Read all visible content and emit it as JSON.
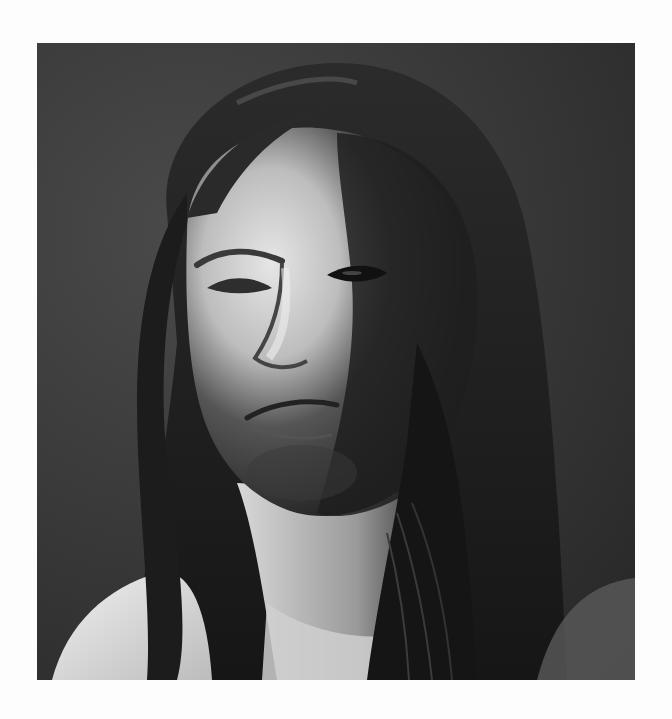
{
  "page": {
    "background": "#fdfdfd"
  },
  "photo": {
    "description": "Black-and-white portrait of a man with long dark hair, face lit from the left, dark studio background",
    "palette": {
      "background_dark": "#2a2a2a",
      "background_mid": "#444444",
      "hair": "#1a1a1a",
      "skin_highlight": "#e8e8e8",
      "skin_mid": "#a0a0a0",
      "shadow": "#202020"
    }
  }
}
